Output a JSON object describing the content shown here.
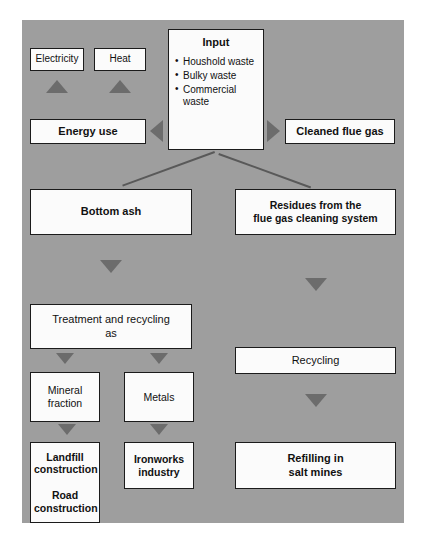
{
  "diagram": {
    "panel_color": "#9e9e9e",
    "box_fill": "#fbfbfb",
    "box_border": "#1b1b1b",
    "arrow_color": "#6c6c6c",
    "line_color": "#595959"
  },
  "nodes": {
    "electricity": {
      "label": "Electricity"
    },
    "heat": {
      "label": "Heat"
    },
    "energy_use": {
      "label": "Energy use"
    },
    "cleaned_flue_gas": {
      "label": "Cleaned flue gas"
    },
    "input": {
      "title": "Input",
      "items": [
        "Houshold waste",
        "Bulky waste",
        "Commercial waste"
      ]
    },
    "bottom_ash": {
      "label": "Bottom ash"
    },
    "residues": {
      "line1": "Residues from the",
      "line2": "flue gas cleaning system"
    },
    "treatment": {
      "line1": "Treatment and recycling",
      "line2": "as"
    },
    "mineral_fraction": {
      "line1": "Mineral",
      "line2": "fraction"
    },
    "metals": {
      "label": "Metals"
    },
    "recycling": {
      "label": "Recycling"
    },
    "landfill_road": {
      "line1": "Landfill",
      "line2": "construction",
      "line3": "Road",
      "line4": "construction"
    },
    "ironworks": {
      "line1": "Ironworks",
      "line2": "industry"
    },
    "refilling": {
      "line1": "Refilling in",
      "line2": "salt mines"
    }
  },
  "arrows": {
    "to_electricity": "arrow-up-icon",
    "to_heat": "arrow-up-icon",
    "to_energy_use": "arrow-left-icon",
    "to_cleaned_flue_gas": "arrow-right-icon",
    "bottom_ash_to_treatment": "arrow-down-icon",
    "residues_to_recycling": "arrow-down-icon",
    "treatment_to_mineral": "arrow-down-icon",
    "treatment_to_metals": "arrow-down-icon",
    "mineral_to_landfill": "arrow-down-icon",
    "metals_to_ironworks": "arrow-down-icon",
    "recycling_to_refilling": "arrow-down-icon"
  }
}
